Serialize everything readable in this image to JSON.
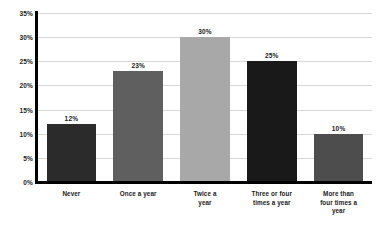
{
  "chart_data": {
    "type": "bar",
    "title": "",
    "subtitle": "",
    "xlabel": "",
    "ylabel": "",
    "ylim": [
      0,
      35
    ],
    "grid": true,
    "legend": "none",
    "categories": [
      "Never",
      "Once a year",
      "Twice a\nyear",
      "Three or four\ntimes a year",
      "More than\nfour times a\nyear"
    ],
    "values": [
      12,
      23,
      30,
      25,
      10
    ],
    "value_labels": [
      "12%",
      "23%",
      "30%",
      "25%",
      "10%"
    ],
    "bar_colors": [
      "#2b2b2b",
      "#5f5f5f",
      "#a8a8a8",
      "#191919",
      "#4d4d4d"
    ],
    "y_ticks": [
      0,
      5,
      10,
      15,
      20,
      25,
      30,
      35
    ],
    "y_tick_labels": [
      "0%",
      "5%",
      "10%",
      "15%",
      "20%",
      "25%",
      "30%",
      "35%"
    ],
    "axis_color": "#000000",
    "gridline_color": "#d8d8d8",
    "text_color": "#1a1a1a",
    "background": "#ffffff"
  }
}
